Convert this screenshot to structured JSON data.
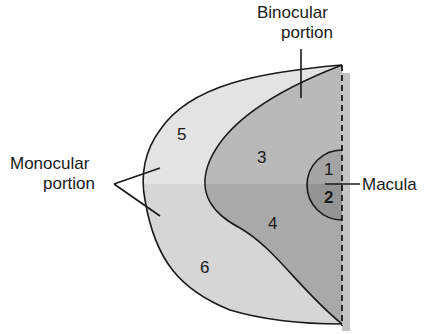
{
  "diagram": {
    "type": "visual field map",
    "labels": {
      "binocular_line1": "Binocular",
      "binocular_line2": "portion",
      "monocular_line1": "Monocular",
      "monocular_line2": "portion",
      "macula": "Macula"
    },
    "regions": {
      "r1": "1",
      "r2": "2",
      "r3": "3",
      "r4": "4",
      "r5": "5",
      "r6": "6"
    },
    "colors": {
      "monocular_upper": "#e2e2e2",
      "monocular_lower": "#d4d4d4",
      "binocular_upper": "#b8b8b8",
      "binocular_lower": "#a8a8a8",
      "macula_upper": "#a0a0a0",
      "macula_lower": "#909090",
      "outline": "#1a1a1a",
      "shadow": "#c8c8c8"
    }
  }
}
